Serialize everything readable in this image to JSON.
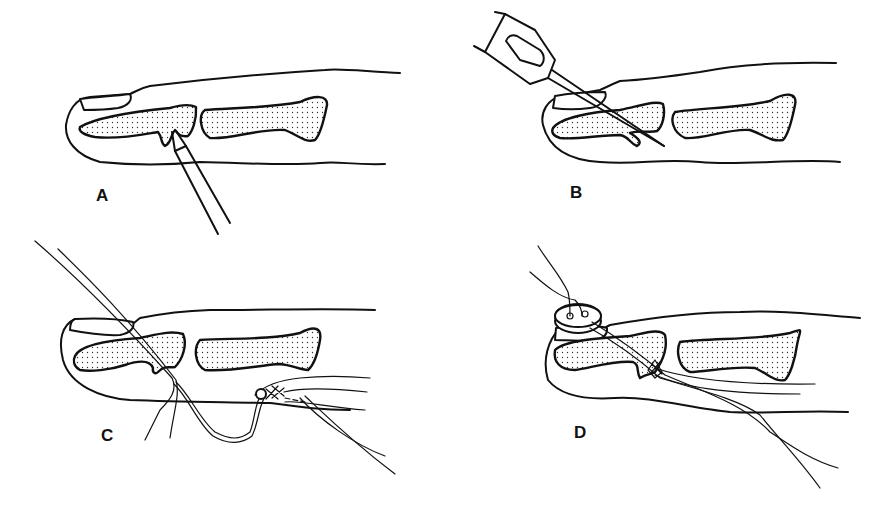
{
  "figure": {
    "panels": [
      {
        "id": "A",
        "label": "A",
        "description": "Fingertip with fractured distal phalanx; instrument probing fracture site"
      },
      {
        "id": "B",
        "label": "B",
        "description": "Needle on syringe hub passed obliquely through nail and distal phalanx"
      },
      {
        "id": "C",
        "label": "C",
        "description": "Suture threaded through needle path; tendon end with cross-stitch looped"
      },
      {
        "id": "D",
        "label": "D",
        "description": "Suture tied over button on nail; tendon drawn to distal phalanx"
      }
    ],
    "colors": {
      "line": "#111111",
      "background": "#ffffff",
      "bone_stipple": "#111111"
    }
  }
}
